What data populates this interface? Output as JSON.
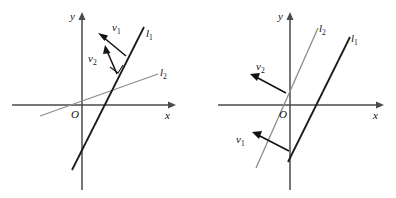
{
  "figure": {
    "background_color": "#ffffff",
    "width": 396,
    "height": 198,
    "colors": {
      "axis": "#4a4a4a",
      "line_dark": "#1a1a1a",
      "line_gray": "#8c8c8c",
      "vector": "#111111",
      "label": "#111111",
      "noise": "#cfcfcf"
    },
    "top_artifacts": {
      "left": "· · · · ·",
      "middle": "· · ·",
      "right": "· · · ·"
    }
  },
  "panels": [
    {
      "id": "left-panel",
      "name": "left-diagram",
      "axes": {
        "x_label": "x",
        "y_label": "y",
        "origin_label": "O",
        "origin_px": {
          "x": 82,
          "y": 105
        },
        "x_extent_px": {
          "from": 12,
          "to": 172
        },
        "y_extent_px": {
          "from": 14,
          "to": 190
        }
      },
      "lines": [
        {
          "name": "line-l1",
          "label": "l",
          "subscript": "1",
          "color": "#1a1a1a",
          "style": "dark",
          "from_px": {
            "x": 73,
            "y": 168
          },
          "to_px": {
            "x": 143,
            "y": 28
          },
          "label_px": {
            "x": 146,
            "y": 36
          }
        },
        {
          "name": "line-l2",
          "label": "l",
          "subscript": "2",
          "color": "#8c8c8c",
          "style": "gray",
          "from_px": {
            "x": 42,
            "y": 115
          },
          "to_px": {
            "x": 158,
            "y": 75
          },
          "label_px": {
            "x": 160,
            "y": 74
          }
        }
      ],
      "vectors": [
        {
          "name": "vector-v1",
          "label": "v",
          "subscript": "1",
          "tail_px": {
            "x": 125,
            "y": 55
          },
          "tip_px": {
            "x": 100,
            "y": 35
          },
          "label_px": {
            "x": 114,
            "y": 27
          }
        },
        {
          "name": "vector-v2",
          "label": "v",
          "subscript": "2",
          "tail_px": {
            "x": 116,
            "y": 74
          },
          "tip_px": {
            "x": 106,
            "y": 48
          },
          "label_px": {
            "x": 92,
            "y": 58
          }
        }
      ],
      "right_angle_tick": {
        "name": "right-angle-tick",
        "at_px": {
          "x": 117,
          "y": 73
        }
      }
    },
    {
      "id": "right-panel",
      "name": "right-diagram",
      "axes": {
        "x_label": "x",
        "y_label": "y",
        "origin_label": "O",
        "origin_px": {
          "x": 290,
          "y": 105
        },
        "x_extent_px": {
          "from": 218,
          "to": 382
        },
        "y_extent_px": {
          "from": 14,
          "to": 190
        }
      },
      "lines": [
        {
          "name": "line-l2",
          "label": "l",
          "subscript": "2",
          "color": "#8c8c8c",
          "style": "gray",
          "from_px": {
            "x": 258,
            "y": 165
          },
          "to_px": {
            "x": 318,
            "y": 29
          },
          "label_px": {
            "x": 320,
            "y": 32
          }
        },
        {
          "name": "line-l1",
          "label": "l",
          "subscript": "1",
          "color": "#1a1a1a",
          "style": "dark",
          "from_px": {
            "x": 290,
            "y": 160
          },
          "to_px": {
            "x": 350,
            "y": 38
          },
          "label_px": {
            "x": 352,
            "y": 42
          }
        }
      ],
      "vectors": [
        {
          "name": "vector-v2",
          "label": "v",
          "subscript": "2",
          "tail_px": {
            "x": 285,
            "y": 92
          },
          "tip_px": {
            "x": 252,
            "y": 75
          },
          "label_px": {
            "x": 258,
            "y": 66
          }
        },
        {
          "name": "vector-v1",
          "label": "v",
          "subscript": "1",
          "tail_px": {
            "x": 288,
            "y": 150
          },
          "tip_px": {
            "x": 254,
            "y": 133
          },
          "label_px": {
            "x": 240,
            "y": 140
          }
        }
      ]
    }
  ]
}
